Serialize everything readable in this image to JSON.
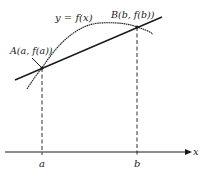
{
  "diagram": {
    "type": "mean-value-theorem-secant",
    "curve_label": "y = f(x)",
    "point_a": {
      "label": "A(a, f(a))",
      "x": 42,
      "y": 68
    },
    "point_b": {
      "label": "B(b, f(b))",
      "x": 137,
      "y": 27
    },
    "x_axis": {
      "label": "x",
      "ticks": [
        "a",
        "b"
      ]
    },
    "colors": {
      "stroke": "#1a1a1a",
      "background": "#ffffff"
    }
  }
}
